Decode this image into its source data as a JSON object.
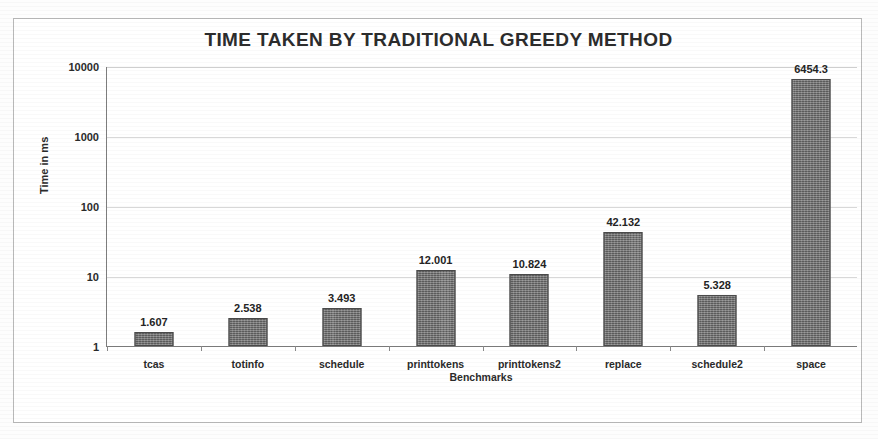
{
  "chart_data": {
    "type": "bar",
    "title": "TIME TAKEN BY TRADITIONAL GREEDY METHOD",
    "xlabel": "Benchmarks",
    "ylabel": "Time in ms",
    "yscale": "log",
    "ylim": [
      1,
      10000
    ],
    "ytick_labels": [
      "10000",
      "1000",
      "100",
      "10",
      "1"
    ],
    "yticks": [
      10000,
      1000,
      100,
      10,
      1
    ],
    "grid": true,
    "legend": false,
    "categories": [
      "tcas",
      "totinfo",
      "schedule",
      "printtokens",
      "printtokens2",
      "replace",
      "schedule2",
      "space"
    ],
    "values": [
      1.607,
      2.538,
      3.493,
      12.001,
      10.824,
      42.132,
      5.328,
      6454.3
    ],
    "value_labels": [
      "1.607",
      "2.538",
      "3.493",
      "12.001",
      "10.824",
      "42.132",
      "5.328",
      "6454.3"
    ],
    "bar_color": "#6d6d6d",
    "bar_edge_color": "#4a4a4a"
  },
  "figure": {
    "background": "#ffffff",
    "frame_color": "#b9b9b9",
    "axis_color": "#7d7d7d",
    "gridline_color": "#d8d8d8",
    "text_color": "#2b2b2b"
  }
}
